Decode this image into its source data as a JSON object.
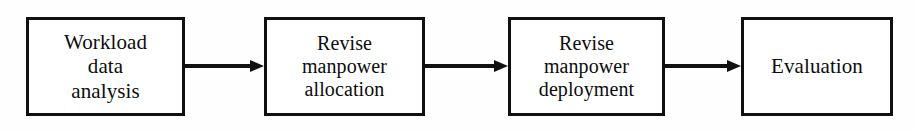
{
  "diagram": {
    "type": "flowchart",
    "orientation": "left-to-right",
    "background_color": "#fefefe",
    "stroke_color": "#111111",
    "text_color": "#0d0d0d",
    "nodes": [
      {
        "id": "node-1",
        "shape": "rectangle",
        "lines": [
          "Workload",
          "data",
          "analysis"
        ],
        "text": "Workload data analysis"
      },
      {
        "id": "node-2",
        "shape": "rectangle",
        "lines": [
          "Revise",
          "manpower",
          "allocation"
        ],
        "text": "Revise manpower allocation"
      },
      {
        "id": "node-3",
        "shape": "rectangle",
        "lines": [
          "Revise",
          "manpower",
          "deployment"
        ],
        "text": "Revise manpower deployment"
      },
      {
        "id": "node-4",
        "shape": "rectangle",
        "lines": [
          "Evaluation"
        ],
        "text": "Evaluation"
      }
    ],
    "connectors": [
      {
        "id": "connector-1",
        "from": "node-1",
        "to": "node-2",
        "style": "arrow",
        "label": ""
      },
      {
        "id": "connector-2",
        "from": "node-2",
        "to": "node-3",
        "style": "arrow",
        "label": ""
      },
      {
        "id": "connector-3",
        "from": "node-3",
        "to": "node-4",
        "style": "arrow",
        "label": ""
      }
    ]
  }
}
